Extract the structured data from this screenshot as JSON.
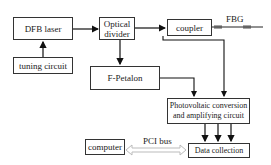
{
  "diagram": {
    "nodes": {
      "dfb_laser": "DFB laser",
      "tuning_circuit": "tuning circuit",
      "optical_divider_line1": "Optical",
      "optical_divider_line2": "divider",
      "coupler": "coupler",
      "f_petalon": "F-Petalon",
      "photovoltaic_line1": "Photovoltaic conversion",
      "photovoltaic_line2": "and amplifying circuit",
      "data_collection": "Data collection",
      "computer": "computer"
    },
    "labels": {
      "fbg": "FBG",
      "pci_bus": "PCI bus"
    },
    "edges": [
      {
        "from": "tuning circuit",
        "to": "DFB laser"
      },
      {
        "from": "DFB laser",
        "to": "Optical divider"
      },
      {
        "from": "Optical divider",
        "to": "coupler"
      },
      {
        "from": "Optical divider",
        "to": "F-Petalon"
      },
      {
        "from": "coupler",
        "to": "FBG"
      },
      {
        "from": "coupler",
        "to": "Photovoltaic conversion and amplifying circuit"
      },
      {
        "from": "F-Petalon",
        "to": "Photovoltaic conversion and amplifying circuit"
      },
      {
        "from": "Photovoltaic conversion and amplifying circuit",
        "to": "Data collection",
        "count": 3
      },
      {
        "from": "computer",
        "to": "Data collection",
        "label": "PCI bus",
        "bidirectional": true
      }
    ]
  }
}
